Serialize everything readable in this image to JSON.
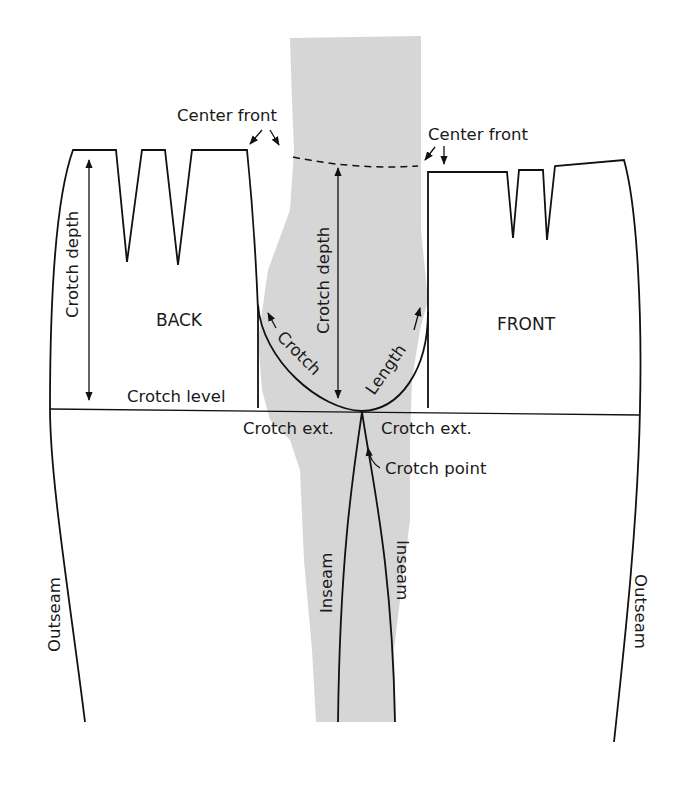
{
  "diagram": {
    "type": "pants pattern crotch diagram",
    "colors": {
      "background": "#ffffff",
      "ink": "#111111",
      "shaded_leg": "#d6d6d6"
    },
    "pieces": {
      "back": {
        "label": "BACK"
      },
      "front": {
        "label": "FRONT"
      }
    },
    "labels": {
      "center_front_left": "Center front",
      "center_front_right": "Center front",
      "crotch_depth_left": "Crotch depth",
      "crotch_depth_center": "Crotch depth",
      "crotch_level": "Crotch level",
      "crotch_curve_word1": "Crotch",
      "crotch_curve_word2": "Length",
      "crotch_ext_left": "Crotch ext.",
      "crotch_ext_right": "Crotch ext.",
      "crotch_point": "Crotch point",
      "inseam_left": "Inseam",
      "inseam_right": "Inseam",
      "outseam_left": "Outseam",
      "outseam_right": "Outseam"
    }
  }
}
